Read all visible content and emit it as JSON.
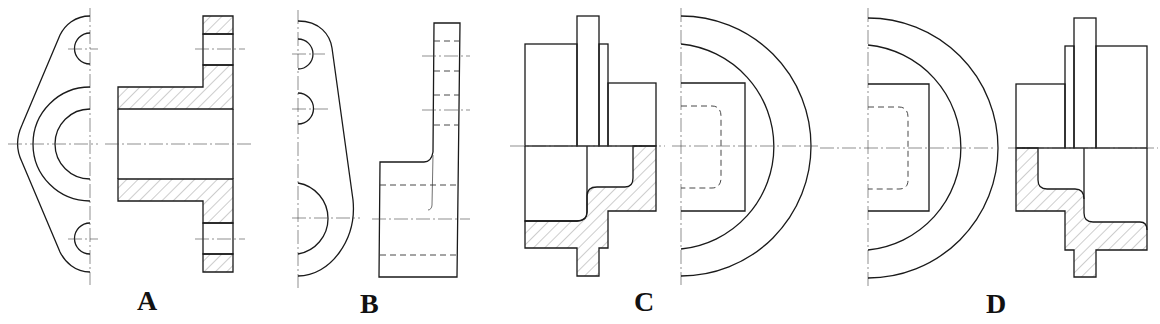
{
  "figure": {
    "type": "engineering drawing - section view options",
    "options": [
      {
        "id": "A",
        "label": "A"
      },
      {
        "id": "B",
        "label": "B"
      },
      {
        "id": "C",
        "label": "C"
      },
      {
        "id": "D",
        "label": "D"
      }
    ]
  },
  "colors": {
    "line": "#1a1a1a",
    "background": "#ffffff"
  }
}
